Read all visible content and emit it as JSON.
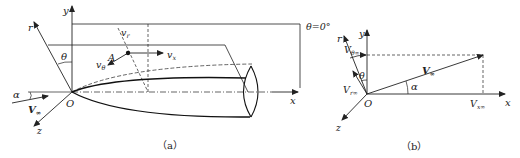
{
  "figure_a": {
    "caption": "（a）",
    "labels": {
      "y": "y",
      "r": "r",
      "theta": "θ",
      "theta_zero": "θ=0°",
      "A": "A",
      "v_r": "v",
      "v_r_sub": "r",
      "v_x": "v",
      "v_x_sub": "x",
      "v_theta": "v",
      "v_theta_sub": "θ",
      "alpha": "α",
      "V_inf": "V",
      "V_inf_sub": "∞",
      "O": "O",
      "z": "z",
      "x": "x"
    }
  },
  "figure_b": {
    "caption": "（b）",
    "labels": {
      "y": "y",
      "r": "r",
      "V_theta_inf": "V",
      "V_theta_inf_sub": "θ∞",
      "theta": "θ",
      "V_r_inf": "V",
      "V_r_inf_sub": "r∞",
      "V_inf": "V",
      "V_inf_sub": "∞",
      "alpha": "α",
      "O": "O",
      "V_x_inf": "V",
      "V_x_inf_sub": "x∞",
      "x": "x",
      "z": "z"
    }
  }
}
